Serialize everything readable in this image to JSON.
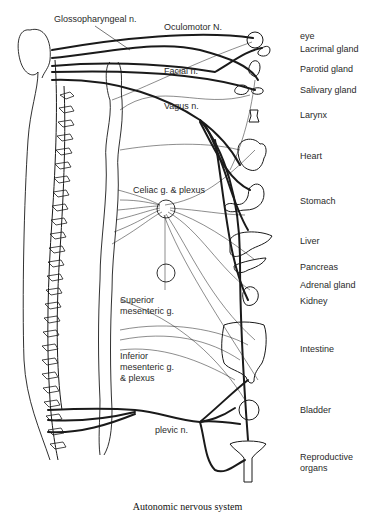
{
  "figure": {
    "caption": "Autonomic nervous system"
  },
  "nerve_labels": {
    "glossopharyngeal": "Glossopharyngeal n.",
    "oculomotor": "Oculomotor N.",
    "facial": "Facial n.",
    "vagus": "Vagus n.",
    "celiac": "Celiac g. & plexus",
    "superior_mesenteric_1": "Superior",
    "superior_mesenteric_2": "mesenteric g.",
    "inferior_mesenteric_1": "Inferior",
    "inferior_mesenteric_2": "mesenteric g.",
    "inferior_mesenteric_3": "& plexus",
    "pelvic": "plevic n."
  },
  "organ_labels": [
    {
      "id": "eye",
      "label": "eye"
    },
    {
      "id": "lacrimal",
      "label": "Lacrimal gland"
    },
    {
      "id": "parotid",
      "label": "Parotid gland"
    },
    {
      "id": "salivary",
      "label": "Salivary gland"
    },
    {
      "id": "larynx",
      "label": "Larynx"
    },
    {
      "id": "heart",
      "label": "Heart"
    },
    {
      "id": "stomach",
      "label": "Stomach"
    },
    {
      "id": "liver",
      "label": "Liver"
    },
    {
      "id": "pancreas",
      "label": "Pancreas"
    },
    {
      "id": "adrenal",
      "label": "Adrenal gland"
    },
    {
      "id": "kidney",
      "label": "Kidney"
    },
    {
      "id": "intestine",
      "label": "Intestine"
    },
    {
      "id": "bladder",
      "label": "Bladder"
    },
    {
      "id": "reproductive_1",
      "label": "Reproductive"
    },
    {
      "id": "reproductive_2",
      "label": "organs"
    }
  ],
  "colors": {
    "ink": "#1a1a1a",
    "background": "#ffffff"
  }
}
